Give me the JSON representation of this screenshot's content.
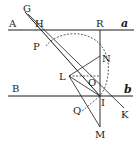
{
  "figure": {
    "line_color": "#1a1a1a",
    "background": "#ffffff",
    "labels": {
      "A": "A",
      "H": "H",
      "G": "G",
      "R": "R",
      "a": "a",
      "P": "P",
      "N": "N",
      "L": "L",
      "O": "O",
      "B": "B",
      "b": "b",
      "I": "I",
      "K": "K",
      "Q": "Q",
      "M": "M"
    },
    "points": {
      "G": [
        28,
        8
      ],
      "H": [
        33,
        30
      ],
      "R": [
        100,
        30
      ],
      "P": [
        44,
        50
      ],
      "N": [
        100,
        55
      ],
      "L": [
        69,
        76
      ],
      "O": [
        92,
        77
      ],
      "I": [
        100,
        96
      ],
      "K": [
        124,
        108
      ],
      "Q": [
        80,
        110
      ],
      "M": [
        100,
        128
      ]
    },
    "lines": [
      {
        "name": "line-Aa",
        "from": "A",
        "to": "a",
        "style": "solid"
      },
      {
        "name": "line-Bb",
        "from": "B",
        "to": "b",
        "style": "solid"
      },
      {
        "name": "line-RM",
        "from": "R",
        "to": "M",
        "style": "solid"
      },
      {
        "name": "line-GI",
        "from": "G",
        "to": "I",
        "style": "solid"
      },
      {
        "name": "line-GK",
        "from": "G",
        "to": "K",
        "style": "solid"
      },
      {
        "name": "line-LN",
        "from": "L",
        "to": "N",
        "style": "solid"
      },
      {
        "name": "line-LI",
        "from": "L",
        "to": "I",
        "style": "solid"
      },
      {
        "name": "line-LO",
        "from": "L",
        "to": "O",
        "style": "dashed"
      },
      {
        "name": "line-LM",
        "from": "L",
        "to": "M",
        "style": "solid"
      },
      {
        "name": "line-QI",
        "from": "Q",
        "to": "I",
        "style": "dashed"
      },
      {
        "name": "arc-PI",
        "from": "P",
        "to": "I",
        "style": "dashed"
      }
    ]
  }
}
